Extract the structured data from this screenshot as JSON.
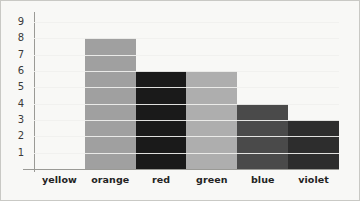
{
  "chart_data": {
    "type": "bar",
    "title": "",
    "subtitle": "",
    "xlabel": "",
    "ylabel": "",
    "categories": [
      "yellow",
      "orange",
      "red",
      "green",
      "blue",
      "violet"
    ],
    "values": [
      0,
      8,
      6,
      6,
      4,
      3
    ],
    "series": [
      {
        "name": "count",
        "values": [
          0,
          8,
          6,
          6,
          4,
          3
        ]
      }
    ],
    "ylim": [
      0,
      9.5
    ],
    "y_ticks": [
      1,
      2,
      3,
      4,
      5,
      6,
      7,
      8,
      9
    ],
    "y_tick_labels": [
      "1",
      "2",
      "3",
      "4",
      "5",
      "6",
      "7",
      "8",
      "9"
    ],
    "grid": true,
    "grid_color": "#f0f0ee",
    "legend": false,
    "legend_position": "none",
    "bar_gap": 0,
    "bar_colors": [
      "#ffffff",
      "#a0a0a0",
      "#1a1a1a",
      "#aeaeae",
      "#4a4a4a",
      "#2d2d2d"
    ],
    "axis_color": "#9a9a96",
    "background_color": "#f8f8f6",
    "border_color": "#c9c9c5",
    "bars": [
      {
        "category": "yellow",
        "value": 0,
        "color": "#ffffff"
      },
      {
        "category": "orange",
        "value": 8,
        "color": "#a0a0a0"
      },
      {
        "category": "red",
        "value": 6,
        "color": "#1a1a1a"
      },
      {
        "category": "green",
        "value": 6,
        "color": "#aeaeae"
      },
      {
        "category": "blue",
        "value": 4,
        "color": "#4a4a4a"
      },
      {
        "category": "violet",
        "value": 3,
        "color": "#2d2d2d"
      }
    ]
  }
}
